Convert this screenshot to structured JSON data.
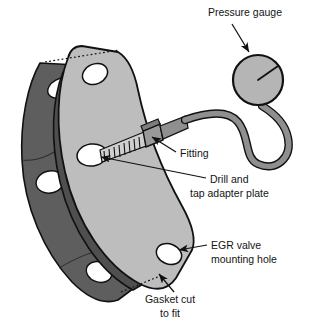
{
  "figure": {
    "title_present": false
  },
  "colors": {
    "plate_fill": "#bdbdbd",
    "plate_edge_fill": "#a8a8a8",
    "gasket_fill": "#5e5e5e",
    "gasket_edge_fill": "#4a4a4a",
    "hole_fill": "#ffffff",
    "gauge_fill": "#b5b5b5",
    "hose_fill": "#8f8f8f",
    "outline": "#111111",
    "fitting_fill": "#9a9a9a",
    "thread_fill": "#cfcfcf",
    "text": "#141414",
    "background": "#ffffff"
  },
  "labels": {
    "pressure_gauge": {
      "lines": [
        "Pressure gauge"
      ],
      "x": 245,
      "y": 16
    },
    "fitting": {
      "lines": [
        "Fitting"
      ],
      "x": 180,
      "y": 157
    },
    "drill_and_tap": {
      "lines": [
        "Drill and",
        "tap adapter plate"
      ],
      "x": 210,
      "y": 183
    },
    "egr_mounting_hole": {
      "lines": [
        "EGR valve",
        "mounting hole"
      ],
      "x": 211,
      "y": 249
    },
    "gasket_cut": {
      "lines": [
        "Gasket cut",
        "to fit"
      ],
      "x": 170,
      "y": 303
    }
  },
  "parts": {
    "adapter_plate": "adapter-plate",
    "gasket": "gasket",
    "fitting": "threaded-fitting",
    "gauge": "pressure-gauge-dial",
    "hose": "gauge-hose",
    "holes": [
      "top-mounting-hole",
      "drilled-tapped-hole",
      "bottom-mounting-hole"
    ],
    "gasket_holes": [
      "gasket-hole-top",
      "gasket-hole-middle",
      "gasket-hole-bottom"
    ]
  }
}
